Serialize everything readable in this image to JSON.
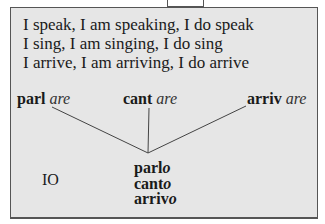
{
  "sentences": [
    "I speak, I am speaking, I do speak",
    "I sing, I am singing, I do sing",
    "I arrive, I am arriving, I do arrive"
  ],
  "infinitives": [
    {
      "stem": "parl",
      "ending": "are"
    },
    {
      "stem": "cant",
      "ending": "are"
    },
    {
      "stem": "arriv",
      "ending": "are"
    }
  ],
  "pronoun": "IO",
  "conjugated": [
    {
      "stem": "parl",
      "ending": "o"
    },
    {
      "stem": "cant",
      "ending": "o"
    },
    {
      "stem": "arriv",
      "ending": "o"
    }
  ],
  "colors": {
    "box_background": "#e6e6e6",
    "border": "#555555",
    "text": "#1a1a1a"
  }
}
